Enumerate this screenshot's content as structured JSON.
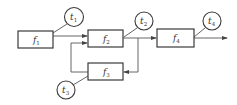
{
  "diagram": {
    "type": "block-flow",
    "blocks": [
      {
        "id": "f1",
        "label": "f",
        "subscript": "1"
      },
      {
        "id": "f2",
        "label": "f",
        "subscript": "2"
      },
      {
        "id": "f3",
        "label": "f",
        "subscript": "3"
      },
      {
        "id": "f4",
        "label": "f",
        "subscript": "4"
      }
    ],
    "nodes": [
      {
        "id": "t1",
        "label": "t",
        "subscript": "1"
      },
      {
        "id": "t2",
        "label": "t",
        "subscript": "2"
      },
      {
        "id": "t3",
        "label": "t",
        "subscript": "3"
      },
      {
        "id": "t4",
        "label": "t",
        "subscript": "4"
      }
    ],
    "edges": [
      {
        "from": "f1",
        "to": "f2"
      },
      {
        "from": "f2",
        "to": "f4"
      },
      {
        "from": "f2",
        "to": "f3",
        "note": "feedback branch"
      },
      {
        "from": "f3",
        "to": "f2",
        "note": "feedback return"
      },
      {
        "from": "f4",
        "to": "output"
      }
    ],
    "colors": {
      "stroke": "#3a3a3a",
      "line": "#555555",
      "background": "#ffffff"
    }
  }
}
